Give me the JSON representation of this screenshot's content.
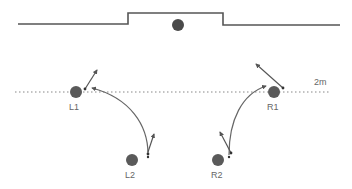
{
  "diagram": {
    "colors": {
      "wall": "#555555",
      "player": "#5a5a5a",
      "ball": "#4a4a4a",
      "path": "#666666",
      "dotted_line": "#b0b0b0",
      "label": "#666666"
    },
    "distance_label": "2m",
    "players": [
      {
        "id": "L1",
        "label": "L1",
        "x": 76,
        "y": 92
      },
      {
        "id": "L2",
        "label": "L2",
        "x": 132,
        "y": 160
      },
      {
        "id": "R1",
        "label": "R1",
        "x": 274,
        "y": 92
      },
      {
        "id": "R2",
        "label": "R2",
        "x": 218,
        "y": 160
      }
    ],
    "ball": {
      "x": 178,
      "y": 25
    }
  }
}
